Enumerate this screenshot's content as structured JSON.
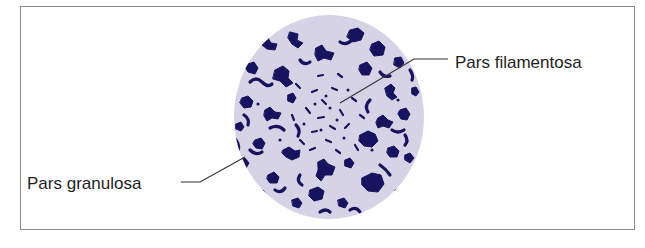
{
  "figure": {
    "labels": {
      "pars_filamentosa": "Pars filamentosa",
      "pars_granulosa": "Pars granulosa"
    },
    "colors": {
      "nucleolus_fill": "#d6d3e6",
      "granule_color": "#16145e",
      "frame_border": "#8a8a8a",
      "leader_line": "#333333"
    }
  }
}
